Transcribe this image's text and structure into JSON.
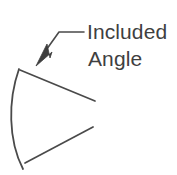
{
  "figure": {
    "title": "Included Angle",
    "background_color": "#ffffff",
    "stroke_color": "#4a4a4a",
    "text_color": "#3f3f3f",
    "annotation": {
      "line1": "Included",
      "line2": "Angle",
      "font_size_px": 21,
      "line1_position": {
        "x": 87,
        "y": 39
      },
      "line2_position": {
        "x": 88,
        "y": 66
      }
    },
    "leader": {
      "name": "leader-line-with-arrowhead",
      "polyline": "84,32 59,32 42,56",
      "arrowhead_tip": {
        "x": 36,
        "y": 66
      },
      "arrowhead_style": "solid-filled-triangle",
      "stroke_width": 1.6
    },
    "wedge": {
      "name": "sector-wedge",
      "arc": {
        "start": {
          "x": 19,
          "y": 69
        },
        "end": {
          "x": 23,
          "y": 169
        },
        "bulge_x": 8,
        "stroke_width": 1.8
      },
      "radial_line_upper": {
        "start": {
          "x": 20,
          "y": 70
        },
        "end": {
          "x": 95,
          "y": 101
        }
      },
      "radial_line_lower": {
        "start": {
          "x": 25,
          "y": 163
        },
        "end": {
          "x": 93,
          "y": 127
        }
      },
      "apex_open": true
    }
  }
}
